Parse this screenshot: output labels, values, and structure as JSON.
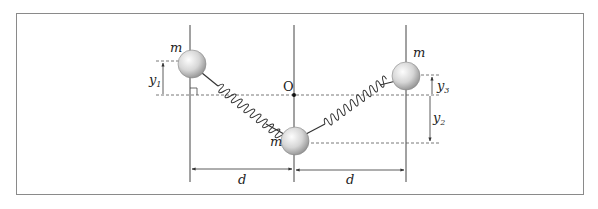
{
  "diagram": {
    "labels": {
      "mass_left": "m",
      "mass_center": "m",
      "mass_right": "m",
      "origin": "O",
      "y1": "y",
      "y1_sub": "1",
      "y2": "y",
      "y2_sub": "2",
      "y3": "y",
      "y3_sub": "3",
      "d_left": "d",
      "d_right": "d"
    },
    "colors": {
      "frame": "#8a8a8a",
      "line": "#444444",
      "dash": "#555555",
      "ball_light": "#f4f4f4",
      "ball_dark": "#9a9a9a",
      "spring": "#333333"
    }
  }
}
